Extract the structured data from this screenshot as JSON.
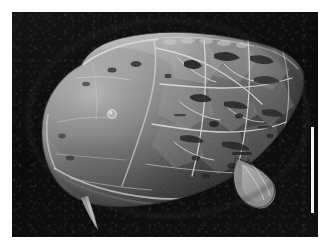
{
  "figure": {
    "kind": "sem-micrograph",
    "medium": "scanning electron microscope photomicrograph",
    "plate_background_color": "#fefefe",
    "field_background_color": "#0c0c0c",
    "width_px": 332,
    "height_px": 250,
    "caption": "",
    "label": ""
  },
  "micrograph": {
    "field_left_px": 12,
    "field_top_px": 12,
    "field_width_px": 306,
    "field_height_px": 225,
    "background_tone": "black",
    "illumination": "upper-left",
    "specimen_tone_light": "#d8d8d8",
    "specimen_tone_mid": "#8f8f8f",
    "specimen_tone_dark": "#3a3a3a"
  },
  "specimen": {
    "name": "fossil carapace",
    "description": "elongate ovate carapace, anterior to the left, posterior tapering to the right",
    "orientation": "lateral view, dorsal margin uppermost",
    "surface": "cracked and exfoliated shell wall with polygonal plates and dark fissures",
    "features": [
      {
        "name": "anterior-margin",
        "position": "left",
        "note": "broadly rounded"
      },
      {
        "name": "dorsal-margin",
        "position": "top",
        "note": "gently arched, slightly nodose"
      },
      {
        "name": "ventral-margin",
        "position": "bottom",
        "note": "nearly straight with overlapping flange"
      },
      {
        "name": "posterior-margin",
        "position": "right",
        "note": "tapering, bluntly pointed"
      },
      {
        "name": "ventral-spine",
        "position": "lower-left",
        "note": "slender downward-directed spine"
      },
      {
        "name": "posteroventral-process",
        "position": "lower-right",
        "note": "angular projecting process"
      },
      {
        "name": "central-tubercle",
        "position": "centre-left",
        "note": "small raised circular tubercle"
      },
      {
        "name": "fracture-network",
        "position": "centre-right",
        "note": "network of cracks outlining broken shell plates"
      }
    ]
  },
  "scale_bar": {
    "visible": true,
    "orientation": "vertical",
    "color": "#f2f2f2",
    "left_px": 299,
    "top_px": 115,
    "length_px": 86,
    "thickness_px": 3,
    "label": ""
  }
}
